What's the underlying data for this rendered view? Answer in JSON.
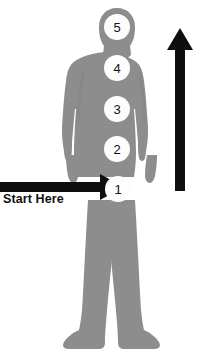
{
  "diagram": {
    "background_color": "#ffffff",
    "body_color": "#8d8d8d",
    "body_shadow_color": "#7e7e7e",
    "arrow_color": "#0f0f0f",
    "circle_fill": "#fdfdfd",
    "circle_text_color": "#111111",
    "figure_name": "human-silhouette"
  },
  "points": [
    {
      "label": "1",
      "x": 118,
      "y": 189,
      "name": "point-1"
    },
    {
      "label": "2",
      "x": 117,
      "y": 149,
      "name": "point-2"
    },
    {
      "label": "3",
      "x": 117,
      "y": 109,
      "name": "point-3"
    },
    {
      "label": "4",
      "x": 117,
      "y": 68,
      "name": "point-4"
    },
    {
      "label": "5",
      "x": 117,
      "y": 27,
      "name": "point-5"
    }
  ],
  "annotations": {
    "start_label": "Start Here",
    "horizontal_arrow": {
      "name": "start-here-arrow",
      "direction": "right",
      "x_start": 0,
      "x_end": 122,
      "y": 187
    },
    "vertical_arrow": {
      "name": "direction-arrow-up",
      "direction": "up",
      "x": 180,
      "y_start": 191,
      "y_end": 30
    }
  }
}
